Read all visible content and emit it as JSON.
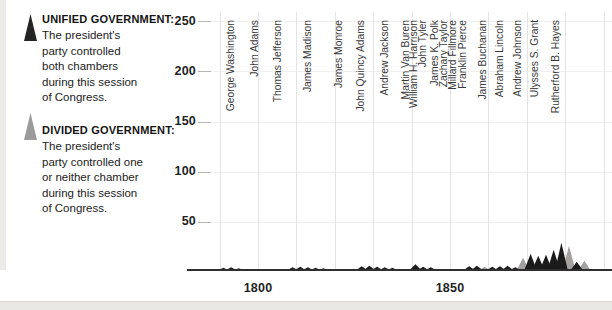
{
  "page": {
    "background": "#ffffff",
    "bottom_strip_color": "#e9e7e4",
    "left_edge_color": "#eceae7"
  },
  "legend": {
    "unified": {
      "title": "UNIFIED GOVERNMENT:",
      "lines": [
        "The president's",
        "party controlled",
        "both chambers",
        "during this session",
        "of Congress."
      ],
      "color": "#242424"
    },
    "divided": {
      "title": "DIVIDED GOVERNMENT:",
      "lines": [
        "The president's",
        "party controlled one",
        "or neither chamber",
        "during this session",
        "of Congress."
      ],
      "color": "#9b9b9b"
    }
  },
  "chart_data": {
    "type": "area",
    "title": "",
    "legend_position": "left",
    "series": [
      {
        "name": "Unified government",
        "color": "#1b1b1b"
      },
      {
        "name": "Divided government",
        "color": "#a2a19f"
      }
    ],
    "sessions": [
      {
        "year": 1791,
        "value": 2,
        "government": "unified"
      },
      {
        "year": 1793,
        "value": 2.5,
        "government": "unified"
      },
      {
        "year": 1795,
        "value": 1.5,
        "government": "unified"
      },
      {
        "year": 1809,
        "value": 2.5,
        "government": "unified"
      },
      {
        "year": 1811,
        "value": 3,
        "government": "unified"
      },
      {
        "year": 1813,
        "value": 2.5,
        "government": "unified"
      },
      {
        "year": 1815,
        "value": 2,
        "government": "unified"
      },
      {
        "year": 1817,
        "value": 1.5,
        "government": "unified"
      },
      {
        "year": 1827,
        "value": 3.5,
        "government": "unified"
      },
      {
        "year": 1829,
        "value": 4,
        "government": "unified"
      },
      {
        "year": 1831,
        "value": 3,
        "government": "unified"
      },
      {
        "year": 1833,
        "value": 2.5,
        "government": "unified"
      },
      {
        "year": 1835,
        "value": 2,
        "government": "unified"
      },
      {
        "year": 1841,
        "value": 5.5,
        "government": "unified"
      },
      {
        "year": 1843,
        "value": 3,
        "government": "unified"
      },
      {
        "year": 1845,
        "value": 2.5,
        "government": "unified"
      },
      {
        "year": 1855,
        "value": 3.5,
        "government": "unified"
      },
      {
        "year": 1857,
        "value": 4,
        "government": "unified"
      },
      {
        "year": 1859,
        "value": 3,
        "government": "divided"
      },
      {
        "year": 1861,
        "value": 3,
        "government": "unified"
      },
      {
        "year": 1863,
        "value": 3.5,
        "government": "unified"
      },
      {
        "year": 1865,
        "value": 4,
        "government": "unified"
      },
      {
        "year": 1867,
        "value": 2.5,
        "government": "unified"
      },
      {
        "year": 1869,
        "value": 12,
        "government": "divided"
      },
      {
        "year": 1871,
        "value": 16,
        "government": "unified"
      },
      {
        "year": 1873,
        "value": 14,
        "government": "unified"
      },
      {
        "year": 1875,
        "value": 15,
        "government": "unified"
      },
      {
        "year": 1877,
        "value": 20,
        "government": "unified"
      },
      {
        "year": 1879,
        "value": 27,
        "government": "unified"
      },
      {
        "year": 1881,
        "value": 24,
        "government": "divided"
      },
      {
        "year": 1883,
        "value": 8,
        "government": "unified"
      },
      {
        "year": 1885,
        "value": 9,
        "government": "divided"
      }
    ],
    "presidents": [
      {
        "name": "George Washington",
        "year": 1793
      },
      {
        "name": "John Adams",
        "year": 1799
      },
      {
        "name": "Thomas Jefferson",
        "year": 1805
      },
      {
        "name": "James Madison",
        "year": 1813
      },
      {
        "name": "James Monroe",
        "year": 1821
      },
      {
        "name": "John Quincy Adams",
        "year": 1826.7
      },
      {
        "name": "Andrew Jackson",
        "year": 1833
      },
      {
        "name": "Martin Van Buren",
        "year": 1838.5
      },
      {
        "name": "William H. Harrison",
        "year": 1840.5
      },
      {
        "name": "John Tyler",
        "year": 1843
      },
      {
        "name": "James K. Polk",
        "year": 1846
      },
      {
        "name": "Zachary Taylor",
        "year": 1848.3
      },
      {
        "name": "Millard Fillmore",
        "year": 1850.7
      },
      {
        "name": "Franklin Pierce",
        "year": 1853.2
      },
      {
        "name": "James Buchanan",
        "year": 1858.4
      },
      {
        "name": "Abraham Lincoln",
        "year": 1863
      },
      {
        "name": "Andrew Johnson",
        "year": 1867.5
      },
      {
        "name": "Ulysses S. Grant",
        "year": 1872.1
      },
      {
        "name": "Rutherford B. Hayes",
        "year": 1877.6
      }
    ],
    "x_axis": {
      "tick_years": [
        1800,
        1850
      ],
      "tick_labels": [
        "1800",
        "1850"
      ],
      "gridline_years": [
        1790,
        1800,
        1810,
        1820,
        1830,
        1840,
        1850,
        1860,
        1870,
        1880,
        1890
      ],
      "range": [
        1787,
        1892
      ]
    },
    "y_axis": {
      "ticks": [
        50,
        100,
        150,
        200,
        250
      ],
      "tick_labels": [
        "50",
        "100",
        "150",
        "200",
        "250"
      ],
      "range": [
        0,
        250
      ],
      "gridlines": true
    }
  }
}
